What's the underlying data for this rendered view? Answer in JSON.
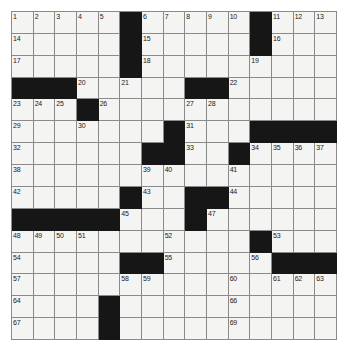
{
  "puzzle": {
    "type": "crossword-grid",
    "rows": 15,
    "columns": 15,
    "colors": {
      "block": "#161616",
      "cell": "#f4f4f2",
      "gridline": "#8a8a8a",
      "number": "#1a1a1a",
      "page_background": "#ffffff"
    },
    "numbered_cells": [
      {
        "number": "1",
        "row": 0,
        "col": 0
      },
      {
        "number": "2",
        "row": 0,
        "col": 1
      },
      {
        "number": "3",
        "row": 0,
        "col": 2
      },
      {
        "number": "4",
        "row": 0,
        "col": 3
      },
      {
        "number": "5",
        "row": 0,
        "col": 4
      },
      {
        "number": "6",
        "row": 0,
        "col": 6
      },
      {
        "number": "7",
        "row": 0,
        "col": 7
      },
      {
        "number": "8",
        "row": 0,
        "col": 8
      },
      {
        "number": "9",
        "row": 0,
        "col": 9
      },
      {
        "number": "10",
        "row": 0,
        "col": 10
      },
      {
        "number": "11",
        "row": 0,
        "col": 12
      },
      {
        "number": "12",
        "row": 0,
        "col": 13
      },
      {
        "number": "13",
        "row": 0,
        "col": 14
      },
      {
        "number": "14",
        "row": 1,
        "col": 0
      },
      {
        "number": "15",
        "row": 1,
        "col": 6
      },
      {
        "number": "16",
        "row": 1,
        "col": 12
      },
      {
        "number": "17",
        "row": 2,
        "col": 0
      },
      {
        "number": "18",
        "row": 2,
        "col": 6
      },
      {
        "number": "19",
        "row": 2,
        "col": 11
      },
      {
        "number": "20",
        "row": 3,
        "col": 3
      },
      {
        "number": "21",
        "row": 3,
        "col": 5
      },
      {
        "number": "22",
        "row": 3,
        "col": 10
      },
      {
        "number": "23",
        "row": 4,
        "col": 0
      },
      {
        "number": "24",
        "row": 4,
        "col": 1
      },
      {
        "number": "25",
        "row": 4,
        "col": 2
      },
      {
        "number": "26",
        "row": 4,
        "col": 4
      },
      {
        "number": "27",
        "row": 4,
        "col": 8
      },
      {
        "number": "28",
        "row": 4,
        "col": 9
      },
      {
        "number": "29",
        "row": 5,
        "col": 0
      },
      {
        "number": "30",
        "row": 5,
        "col": 3
      },
      {
        "number": "31",
        "row": 5,
        "col": 8
      },
      {
        "number": "32",
        "row": 6,
        "col": 0
      },
      {
        "number": "33",
        "row": 6,
        "col": 8
      },
      {
        "number": "34",
        "row": 6,
        "col": 11
      },
      {
        "number": "35",
        "row": 6,
        "col": 12
      },
      {
        "number": "36",
        "row": 6,
        "col": 13
      },
      {
        "number": "37",
        "row": 6,
        "col": 14
      },
      {
        "number": "38",
        "row": 7,
        "col": 0
      },
      {
        "number": "39",
        "row": 7,
        "col": 6
      },
      {
        "number": "40",
        "row": 7,
        "col": 7
      },
      {
        "number": "41",
        "row": 7,
        "col": 10
      },
      {
        "number": "42",
        "row": 8,
        "col": 0
      },
      {
        "number": "43",
        "row": 8,
        "col": 6
      },
      {
        "number": "44",
        "row": 8,
        "col": 10
      },
      {
        "number": "45",
        "row": 9,
        "col": 5
      },
      {
        "number": "46",
        "row": 9,
        "col": 8
      },
      {
        "number": "47",
        "row": 9,
        "col": 9
      },
      {
        "number": "48",
        "row": 10,
        "col": 0
      },
      {
        "number": "49",
        "row": 10,
        "col": 1
      },
      {
        "number": "50",
        "row": 10,
        "col": 2
      },
      {
        "number": "51",
        "row": 10,
        "col": 3
      },
      {
        "number": "52",
        "row": 10,
        "col": 7
      },
      {
        "number": "53",
        "row": 10,
        "col": 12
      },
      {
        "number": "54",
        "row": 11,
        "col": 0
      },
      {
        "number": "55",
        "row": 11,
        "col": 7
      },
      {
        "number": "56",
        "row": 11,
        "col": 11
      },
      {
        "number": "57",
        "row": 12,
        "col": 0
      },
      {
        "number": "58",
        "row": 12,
        "col": 5
      },
      {
        "number": "59",
        "row": 12,
        "col": 6
      },
      {
        "number": "60",
        "row": 12,
        "col": 10
      },
      {
        "number": "61",
        "row": 12,
        "col": 12
      },
      {
        "number": "62",
        "row": 12,
        "col": 13
      },
      {
        "number": "63",
        "row": 12,
        "col": 14
      },
      {
        "number": "64",
        "row": 13,
        "col": 0
      },
      {
        "number": "65",
        "row": 13,
        "col": 4
      },
      {
        "number": "66",
        "row": 13,
        "col": 10
      },
      {
        "number": "67",
        "row": 14,
        "col": 0
      },
      {
        "number": "68",
        "row": 14,
        "col": 4
      },
      {
        "number": "69",
        "row": 14,
        "col": 10
      }
    ],
    "grid": [
      [
        0,
        0,
        0,
        0,
        0,
        1,
        0,
        0,
        0,
        0,
        0,
        1,
        0,
        0,
        0
      ],
      [
        0,
        0,
        0,
        0,
        0,
        1,
        0,
        0,
        0,
        0,
        0,
        1,
        0,
        0,
        0
      ],
      [
        0,
        0,
        0,
        0,
        0,
        1,
        0,
        0,
        0,
        0,
        0,
        0,
        0,
        0,
        0
      ],
      [
        1,
        1,
        1,
        0,
        0,
        0,
        0,
        0,
        1,
        1,
        0,
        0,
        0,
        0,
        0
      ],
      [
        0,
        0,
        0,
        1,
        0,
        0,
        0,
        0,
        0,
        0,
        0,
        0,
        0,
        0,
        0
      ],
      [
        0,
        0,
        0,
        0,
        0,
        0,
        0,
        1,
        0,
        0,
        0,
        1,
        1,
        1,
        1
      ],
      [
        0,
        0,
        0,
        0,
        0,
        0,
        1,
        1,
        0,
        0,
        1,
        0,
        0,
        0,
        0
      ],
      [
        0,
        0,
        0,
        0,
        0,
        0,
        0,
        0,
        0,
        0,
        0,
        0,
        0,
        0,
        0
      ],
      [
        0,
        0,
        0,
        0,
        0,
        1,
        0,
        0,
        1,
        1,
        0,
        0,
        0,
        0,
        0
      ],
      [
        1,
        1,
        1,
        1,
        1,
        0,
        0,
        0,
        1,
        0,
        0,
        0,
        0,
        0,
        0
      ],
      [
        0,
        0,
        0,
        0,
        0,
        0,
        0,
        0,
        0,
        0,
        0,
        1,
        0,
        0,
        0
      ],
      [
        0,
        0,
        0,
        0,
        0,
        1,
        1,
        0,
        0,
        0,
        0,
        0,
        1,
        1,
        1
      ],
      [
        0,
        0,
        0,
        0,
        0,
        0,
        0,
        0,
        0,
        0,
        0,
        0,
        0,
        0,
        0
      ],
      [
        0,
        0,
        0,
        0,
        1,
        0,
        0,
        0,
        0,
        0,
        0,
        0,
        0,
        0,
        0
      ],
      [
        0,
        0,
        0,
        0,
        1,
        0,
        0,
        0,
        0,
        0,
        0,
        0,
        0,
        0,
        0
      ]
    ],
    "letters": []
  }
}
